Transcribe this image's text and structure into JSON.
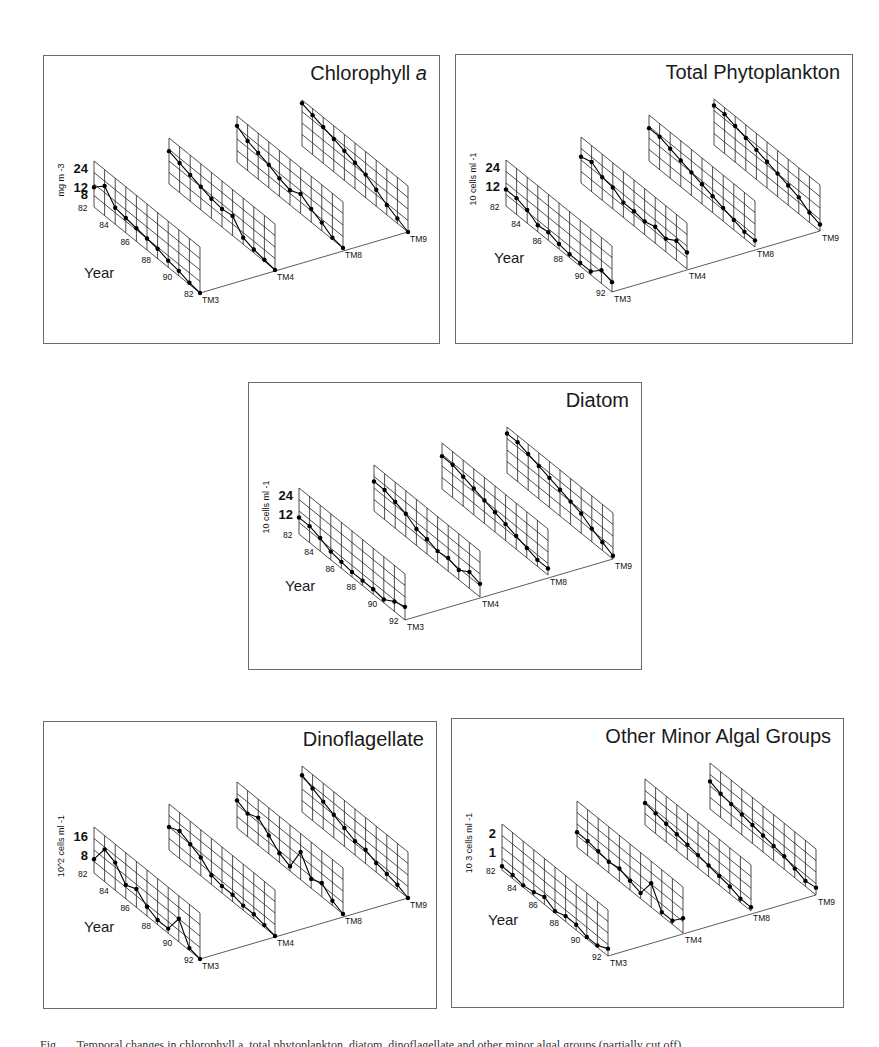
{
  "figure": {
    "caption_visible": "Fig. … Temporal changes in chlorophyll a, total phytoplankton, diatom, dinoflagellate and other minor algal groups (partially cut off)"
  },
  "chart_data": [
    {
      "type": "line",
      "id": "chlorophyll",
      "title": "Chlorophyll",
      "title_italic_suffix": "a",
      "ylabel": "mg m -3",
      "ytick_labels": [
        "8",
        "12",
        "24"
      ],
      "xlabel": "Year",
      "year_tick_labels": [
        "82",
        "84",
        "86",
        "88",
        "90",
        "82"
      ],
      "stations": [
        "TM3",
        "TM4",
        "TM8",
        "TM9"
      ],
      "years": [
        82,
        83,
        84,
        85,
        86,
        87,
        88,
        89,
        90,
        91,
        92
      ],
      "grid": true,
      "series": [
        {
          "name": "TM3",
          "values": [
            12,
            18,
            10,
            9,
            8,
            7,
            6,
            4,
            3,
            1,
            0
          ]
        },
        {
          "name": "TM4",
          "values": [
            20,
            18,
            16,
            14,
            12,
            11,
            12,
            4,
            2,
            1,
            0
          ]
        },
        {
          "name": "TM8",
          "values": [
            22,
            18,
            16,
            14,
            11,
            9,
            12,
            8,
            5,
            1,
            0
          ]
        },
        {
          "name": "TM9",
          "values": [
            26,
            24,
            22,
            20,
            18,
            16,
            14,
            10,
            6,
            3,
            0
          ]
        }
      ]
    },
    {
      "type": "line",
      "id": "total-phytoplankton",
      "title": "Total Phytoplankton",
      "ylabel": "10 cells ml -1",
      "ytick_labels": [
        "12",
        "24"
      ],
      "xlabel": "Year",
      "year_tick_labels": [
        "82",
        "84",
        "86",
        "88",
        "90",
        "92"
      ],
      "stations": [
        "TM3",
        "TM4",
        "TM8",
        "TM9"
      ],
      "years": [
        82,
        83,
        84,
        85,
        86,
        87,
        88,
        89,
        90,
        91,
        92
      ],
      "grid": true,
      "series": [
        {
          "name": "TM3",
          "values": [
            10,
            10,
            8,
            4,
            5,
            3,
            2,
            2,
            2,
            8,
            6
          ]
        },
        {
          "name": "TM4",
          "values": [
            16,
            18,
            14,
            13,
            9,
            9,
            8,
            10,
            8,
            12,
            10
          ]
        },
        {
          "name": "TM8",
          "values": [
            20,
            20,
            18,
            16,
            14,
            12,
            10,
            8,
            6,
            4,
            4
          ]
        },
        {
          "name": "TM9",
          "values": [
            24,
            24,
            22,
            20,
            18,
            16,
            14,
            12,
            10,
            6,
            4
          ]
        }
      ]
    },
    {
      "type": "line",
      "id": "diatom",
      "title": "Diatom",
      "ylabel": "10 cells ml -1",
      "ytick_labels": [
        "12",
        "24"
      ],
      "xlabel": "Year",
      "year_tick_labels": [
        "82",
        "84",
        "86",
        "88",
        "90",
        "92"
      ],
      "stations": [
        "TM3",
        "TM4",
        "TM8",
        "TM9"
      ],
      "years": [
        82,
        83,
        84,
        85,
        86,
        87,
        88,
        89,
        90,
        91,
        92
      ],
      "grid": true,
      "series": [
        {
          "name": "TM3",
          "values": [
            10,
            10,
            8,
            5,
            4,
            3,
            3,
            3,
            2,
            6,
            8
          ]
        },
        {
          "name": "TM4",
          "values": [
            18,
            18,
            16,
            14,
            10,
            9,
            7,
            8,
            6,
            10,
            8
          ]
        },
        {
          "name": "TM8",
          "values": [
            20,
            20,
            18,
            16,
            14,
            12,
            10,
            8,
            6,
            4,
            4
          ]
        },
        {
          "name": "TM9",
          "values": [
            24,
            24,
            22,
            20,
            18,
            16,
            14,
            12,
            8,
            5,
            2
          ]
        }
      ]
    },
    {
      "type": "line",
      "id": "dinoflagellate",
      "title": "Dinoflagellate",
      "ylabel": "10^2 cells ml -1",
      "ytick_labels": [
        "8",
        "16"
      ],
      "xlabel": "Year",
      "year_tick_labels": [
        "82",
        "84",
        "86",
        "88",
        "90",
        "92"
      ],
      "stations": [
        "TM3",
        "TM4",
        "TM8",
        "TM9"
      ],
      "years": [
        82,
        83,
        84,
        85,
        86,
        87,
        88,
        89,
        90,
        91,
        92
      ],
      "grid": true,
      "series": [
        {
          "name": "TM3",
          "values": [
            6,
            14,
            12,
            6,
            8,
            4,
            2,
            2,
            10,
            1,
            0
          ]
        },
        {
          "name": "TM4",
          "values": [
            10,
            12,
            10,
            8,
            4,
            3,
            3,
            2,
            2,
            1,
            0
          ]
        },
        {
          "name": "TM8",
          "values": [
            12,
            10,
            12,
            8,
            4,
            2,
            12,
            4,
            6,
            2,
            0
          ]
        },
        {
          "name": "TM9",
          "values": [
            16,
            14,
            12,
            10,
            8,
            6,
            6,
            4,
            3,
            2,
            0
          ]
        }
      ]
    },
    {
      "type": "line",
      "id": "other-minor-algal-groups",
      "title": "Other Minor Algal Groups",
      "ylabel": "10 3 cells ml -1",
      "ytick_labels": [
        "1",
        "2"
      ],
      "xlabel": "Year",
      "year_tick_labels": [
        "82",
        "84",
        "86",
        "88",
        "90",
        "92"
      ],
      "stations": [
        "TM3",
        "TM4",
        "TM8",
        "TM9"
      ],
      "years": [
        82,
        83,
        84,
        85,
        86,
        87,
        88,
        89,
        90,
        91,
        92
      ],
      "grid": true,
      "series": [
        {
          "name": "TM3",
          "values": [
            0.2,
            0.2,
            0.1,
            0.2,
            0.4,
            0.1,
            0.3,
            0.3,
            0.1,
            0.1,
            0.4
          ]
        },
        {
          "name": "TM4",
          "values": [
            0.8,
            0.8,
            0.7,
            0.6,
            0.7,
            0.5,
            0.3,
            1.3,
            0.2,
            0.2,
            0.8
          ]
        },
        {
          "name": "TM8",
          "values": [
            1.2,
            1.1,
            1.0,
            0.9,
            0.8,
            0.7,
            0.6,
            0.5,
            0.4,
            0.2,
            0.2
          ]
        },
        {
          "name": "TM9",
          "values": [
            1.5,
            1.3,
            1.2,
            1.1,
            1.0,
            0.9,
            0.8,
            0.7,
            0.5,
            0.3,
            0.4
          ]
        }
      ]
    }
  ],
  "panels": [
    {
      "id": "chlorophyll",
      "x": 43,
      "y": 55,
      "w": 397,
      "h": 289,
      "ymax": 28,
      "year_label_pos": [
        40,
        208
      ],
      "yticks_val": [
        8,
        12,
        24
      ]
    },
    {
      "id": "total-phytoplankton",
      "x": 455,
      "y": 54,
      "w": 398,
      "h": 290,
      "ymax": 28,
      "year_label_pos": [
        38,
        194
      ],
      "yticks_val": [
        12,
        24
      ]
    },
    {
      "id": "diatom",
      "x": 248,
      "y": 382,
      "w": 394,
      "h": 288,
      "ymax": 28,
      "year_label_pos": [
        36,
        194
      ],
      "yticks_val": [
        12,
        24
      ]
    },
    {
      "id": "dinoflagellate",
      "x": 43,
      "y": 721,
      "w": 394,
      "h": 288,
      "ymax": 20,
      "year_label_pos": [
        40,
        196
      ],
      "yticks_val": [
        8,
        16
      ]
    },
    {
      "id": "other-minor-algal-groups",
      "x": 451,
      "y": 718,
      "w": 393,
      "h": 290,
      "ymax": 2.5,
      "year_label_pos": [
        36,
        192
      ],
      "yticks_val": [
        1,
        2
      ]
    }
  ]
}
